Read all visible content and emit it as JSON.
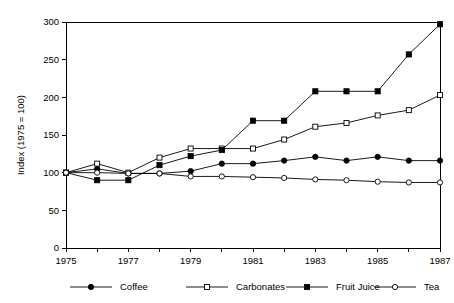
{
  "chart_data": {
    "type": "line",
    "title": "",
    "xlabel": "",
    "ylabel": "Index (1975 = 100)",
    "xlim": [
      1975,
      1987
    ],
    "ylim": [
      0,
      300
    ],
    "yticks": [
      0,
      50,
      100,
      150,
      200,
      250,
      300
    ],
    "ytick_labels": [
      "0",
      "50",
      "100",
      "150",
      "200",
      "250",
      "300"
    ],
    "x": [
      1975,
      1976,
      1977,
      1978,
      1979,
      1980,
      1981,
      1982,
      1983,
      1984,
      1985,
      1986,
      1987
    ],
    "xticks": [
      1975,
      1976,
      1977,
      1978,
      1979,
      1980,
      1981,
      1982,
      1983,
      1984,
      1985,
      1986,
      1987
    ],
    "xtick_labels": [
      "1975",
      "",
      "1977",
      "",
      "1979",
      "",
      "1981",
      "",
      "1983",
      "",
      "1985",
      "",
      "1987"
    ],
    "grid": false,
    "legend_position": "bottom",
    "series": [
      {
        "name": "Coffee",
        "marker": "filled-circle",
        "values": [
          100,
          105,
          99,
          99,
          102,
          112,
          112,
          116,
          121,
          116,
          121,
          116,
          116
        ]
      },
      {
        "name": "Carbonates",
        "marker": "open-square",
        "values": [
          100,
          112,
          100,
          120,
          132,
          132,
          132,
          144,
          161,
          166,
          176,
          183,
          203
        ]
      },
      {
        "name": "Fruit Juice",
        "marker": "filled-square",
        "values": [
          100,
          90,
          90,
          110,
          122,
          130,
          169,
          169,
          208,
          208,
          208,
          257,
          297
        ]
      },
      {
        "name": "Tea",
        "marker": "open-circle",
        "values": [
          100,
          100,
          99,
          99,
          95,
          95,
          94,
          93,
          91,
          90,
          88,
          87,
          87
        ]
      }
    ]
  },
  "legend": {
    "items": [
      {
        "label": "Coffee",
        "marker": "filled-circle"
      },
      {
        "label": "Carbonates",
        "marker": "open-square"
      },
      {
        "label": "Fruit Juice",
        "marker": "filled-square"
      },
      {
        "label": "Tea",
        "marker": "open-circle"
      }
    ]
  }
}
